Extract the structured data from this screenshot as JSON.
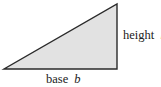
{
  "diagram": {
    "shape": "right-triangle",
    "vertices": {
      "bottom_left": [
        4,
        69
      ],
      "bottom_right": [
        117,
        69
      ],
      "top_right": [
        117,
        4
      ]
    },
    "colors": {
      "fill": "#e2e2e2",
      "stroke": "#2a2a2a",
      "text": "#222222"
    },
    "labels": {
      "height": {
        "word": "height",
        "var": "h"
      },
      "base": {
        "word": "base",
        "var": "b"
      }
    }
  }
}
